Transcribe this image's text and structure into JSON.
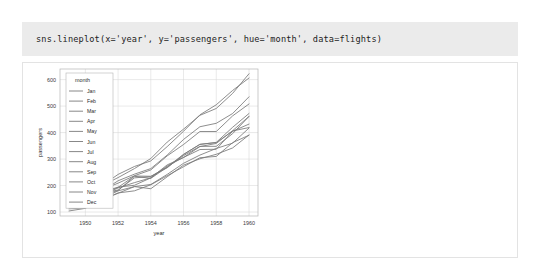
{
  "code_cell": {
    "source": "sns.lineplot(x='year', y='passengers', hue='month', data=flights)"
  },
  "colors": {
    "code_background": "#ebebeb",
    "code_text": "#1c1c1c",
    "panel_background": "#ffffff",
    "panel_border": "#e3e3e3",
    "grid": "#d6d6d6",
    "spine": "#b5b5b5",
    "tick_text": "#3a3a3a",
    "line": "#7a7a7a"
  },
  "chart_data": {
    "type": "line",
    "title": "",
    "xlabel": "year",
    "ylabel": "passengers",
    "grid": true,
    "legend_position": "upper left",
    "legend_title": "month",
    "x": [
      1949,
      1950,
      1951,
      1952,
      1953,
      1954,
      1955,
      1956,
      1957,
      1958,
      1959,
      1960
    ],
    "xlim": [
      1948.45,
      1960.55
    ],
    "ylim": [
      85,
      640
    ],
    "xticks": [
      1950,
      1952,
      1954,
      1956,
      1958,
      1960
    ],
    "yticks": [
      100,
      200,
      300,
      400,
      500,
      600
    ],
    "series": [
      {
        "name": "Jan",
        "values": [
          112,
          115,
          145,
          171,
          196,
          204,
          242,
          284,
          315,
          340,
          360,
          417
        ]
      },
      {
        "name": "Feb",
        "values": [
          118,
          126,
          150,
          180,
          196,
          188,
          233,
          277,
          301,
          318,
          342,
          391
        ]
      },
      {
        "name": "Mar",
        "values": [
          132,
          141,
          178,
          193,
          236,
          235,
          267,
          317,
          356,
          362,
          406,
          419
        ]
      },
      {
        "name": "Apr",
        "values": [
          129,
          135,
          163,
          181,
          235,
          227,
          269,
          313,
          348,
          348,
          396,
          461
        ]
      },
      {
        "name": "May",
        "values": [
          121,
          125,
          172,
          183,
          229,
          234,
          270,
          318,
          355,
          363,
          420,
          472
        ]
      },
      {
        "name": "Jun",
        "values": [
          135,
          149,
          178,
          218,
          243,
          264,
          315,
          374,
          422,
          435,
          472,
          535
        ]
      },
      {
        "name": "Jul",
        "values": [
          148,
          170,
          199,
          230,
          264,
          302,
          364,
          413,
          465,
          491,
          548,
          622
        ]
      },
      {
        "name": "Aug",
        "values": [
          148,
          170,
          199,
          242,
          272,
          293,
          347,
          405,
          467,
          505,
          559,
          606
        ]
      },
      {
        "name": "Sep",
        "values": [
          136,
          158,
          184,
          209,
          237,
          259,
          312,
          355,
          404,
          404,
          463,
          508
        ]
      },
      {
        "name": "Oct",
        "values": [
          119,
          133,
          162,
          191,
          211,
          229,
          274,
          306,
          347,
          359,
          407,
          461
        ]
      },
      {
        "name": "Nov",
        "values": [
          104,
          114,
          146,
          172,
          180,
          203,
          237,
          271,
          305,
          310,
          362,
          390
        ]
      },
      {
        "name": "Dec",
        "values": [
          118,
          140,
          166,
          194,
          201,
          229,
          278,
          306,
          336,
          337,
          405,
          432
        ]
      }
    ]
  }
}
